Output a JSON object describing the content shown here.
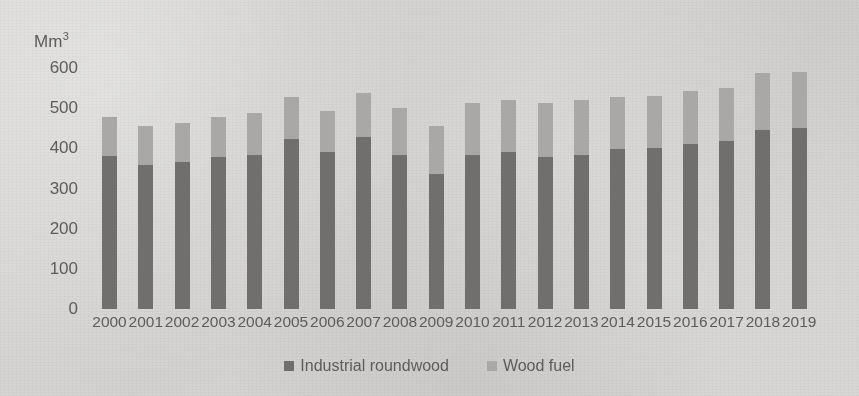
{
  "chart_data": {
    "type": "bar",
    "subtype": "stacked-column",
    "title": "",
    "xlabel": "",
    "ylabel": "Mm3",
    "ylabel_display": "Mm",
    "ylabel_superscript": "3",
    "ylim": [
      0,
      600
    ],
    "yticks": [
      600,
      500,
      400,
      300,
      200,
      100,
      0
    ],
    "grid": false,
    "legend_position": "bottom",
    "categories": [
      "2000",
      "2001",
      "2002",
      "2003",
      "2004",
      "2005",
      "2006",
      "2007",
      "2008",
      "2009",
      "2010",
      "2011",
      "2012",
      "2013",
      "2014",
      "2015",
      "2016",
      "2017",
      "2018",
      "2019"
    ],
    "series": [
      {
        "name": "Industrial roundwood",
        "color": "#706f6d",
        "values": [
          381,
          358,
          365,
          378,
          383,
          424,
          391,
          428,
          384,
          336,
          383,
          391,
          379,
          383,
          398,
          401,
          411,
          419,
          446,
          450
        ]
      },
      {
        "name": "Wood fuel",
        "color": "#a9a8a6",
        "values": [
          97,
          97,
          99,
          100,
          105,
          104,
          103,
          110,
          116,
          119,
          130,
          130,
          134,
          137,
          130,
          130,
          131,
          131,
          141,
          141
        ]
      }
    ],
    "totals": [
      478,
      455,
      464,
      478,
      488,
      528,
      494,
      538,
      500,
      455,
      513,
      521,
      513,
      520,
      528,
      531,
      542,
      550,
      587,
      591
    ]
  },
  "legend": {
    "items": [
      {
        "label": "Industrial roundwood",
        "color": "#706f6d"
      },
      {
        "label": "Wood fuel",
        "color": "#a9a8a6"
      }
    ]
  }
}
